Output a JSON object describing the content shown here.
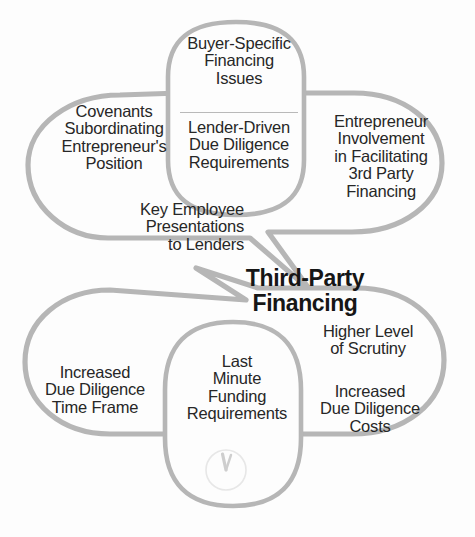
{
  "diagram": {
    "title": "Third-Party Financing",
    "title_lines": "Third-Party\nFinancing",
    "outline_color": "#b6b6b6",
    "fill_color": "#fdfdfd",
    "text_color": "#272727",
    "background_color": "#ffffff"
  },
  "top_cluster": {
    "left_lobe": {
      "label": "Covenants Subordinating Entrepreneur's Position",
      "lines": "Covenants\nSubordinating\nEntrepreneur's\nPosition"
    },
    "center_capsule_upper": {
      "label": "Buyer-Specific Financing Issues",
      "lines": "Buyer-Specific\nFinancing\nIssues"
    },
    "center_capsule_lower": {
      "label": "Lender-Driven Due Diligence Requirements",
      "lines": "Lender-Driven\nDue Diligence\nRequirements"
    },
    "right_lobe": {
      "label": "Entrepreneur Involvement in Facilitating 3rd Party Financing",
      "lines": "Entrepreneur\nInvolvement\nin Facilitating\n3rd Party\nFinancing"
    },
    "lower_left_note": {
      "label": "Key Employee Presentations to Lenders",
      "lines": "Key Employee\nPresentations\nto Lenders"
    }
  },
  "bottom_cluster": {
    "left_lobe": {
      "label": "Increased Due Diligence Time Frame",
      "lines": "Increased\nDue Diligence\nTime Frame"
    },
    "center_capsule": {
      "label": "Last Minute Funding Requirements",
      "lines": "Last\nMinute\nFunding\nRequirements"
    },
    "right_lobe_upper": {
      "label": "Higher Level of Scrutiny",
      "lines": "Higher Level\nof Scrutiny"
    },
    "right_lobe_lower": {
      "label": "Increased Due Diligence Costs",
      "lines": "Increased\nDue Diligence\nCosts"
    },
    "clock_icon": {
      "name": "clock-icon",
      "description": "faint clock face near eleven fifty-five"
    }
  }
}
